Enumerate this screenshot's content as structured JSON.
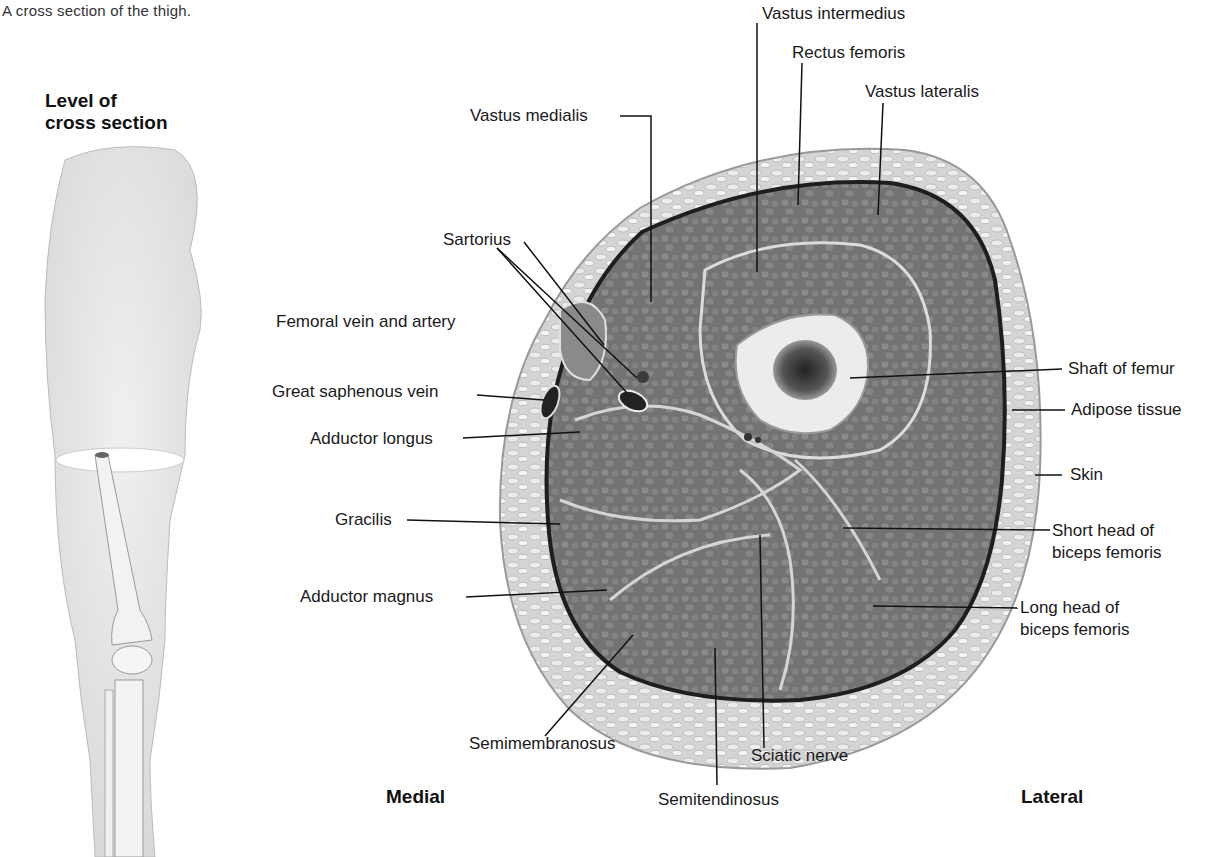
{
  "caption": "A cross section of the thigh.",
  "level_panel": {
    "title_line1": "Level of",
    "title_line2": "cross section"
  },
  "directions": {
    "medial": "Medial",
    "lateral": "Lateral"
  },
  "labels": {
    "vastus_intermedius": "Vastus intermedius",
    "rectus_femoris": "Rectus femoris",
    "vastus_lateralis": "Vastus lateralis",
    "vastus_medialis": "Vastus medialis",
    "sartorius": "Sartorius",
    "femoral_vein_artery": "Femoral vein and artery",
    "great_saphenous_vein": "Great saphenous vein",
    "adductor_longus": "Adductor longus",
    "gracilis": "Gracilis",
    "adductor_magnus": "Adductor magnus",
    "semimembranosus": "Semimembranosus",
    "semitendinosus": "Semitendinosus",
    "sciatic_nerve": "Sciatic nerve",
    "shaft_of_femur": "Shaft of femur",
    "adipose_tissue": "Adipose tissue",
    "skin": "Skin",
    "short_head_line1": "Short head of",
    "short_head_line2": "biceps femoris",
    "long_head_line1": "Long head of",
    "long_head_line2": "biceps femoris"
  },
  "colors": {
    "background": "#ffffff",
    "skin_fat": "#d9d9d9",
    "muscle": "#7d7d7d",
    "fascia": "#2a2a2a",
    "bone": "#ececec",
    "marrow": "#444444",
    "leader": "#111111"
  }
}
